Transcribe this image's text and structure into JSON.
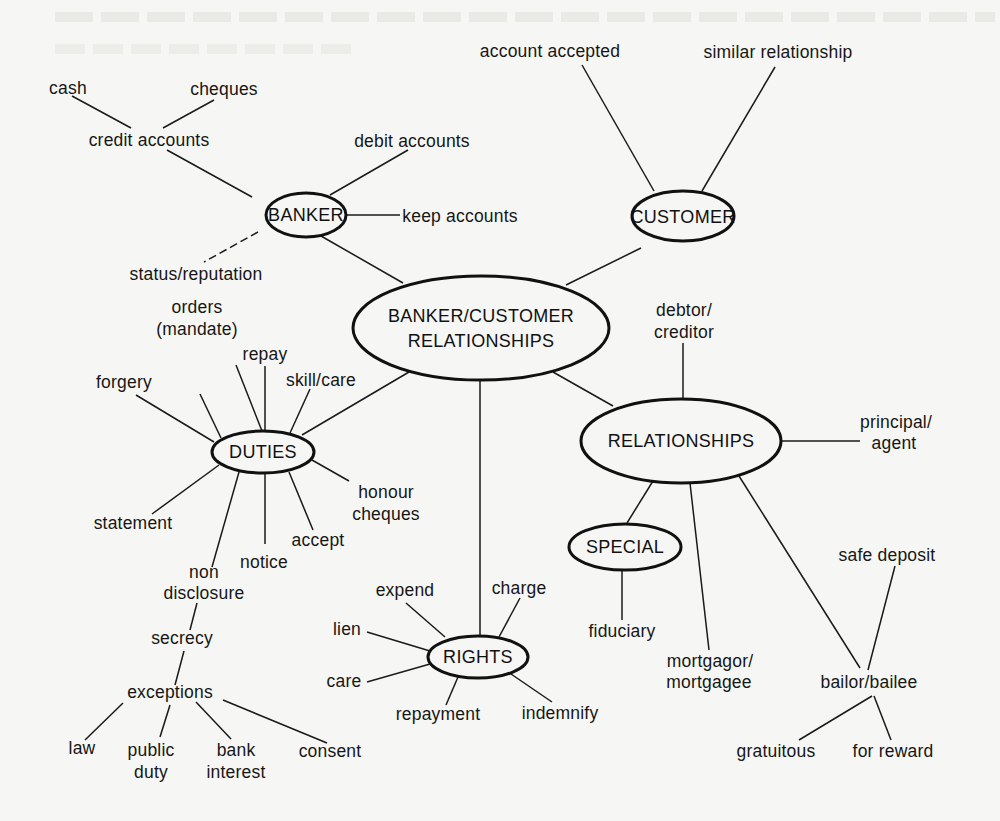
{
  "diagram": {
    "title": "BANKER/CUSTOMER RELATIONSHIPS",
    "colors": {
      "background": "#f6f6f4",
      "ink": "#111111"
    },
    "nodes": {
      "central": {
        "label_line1": "BANKER/CUSTOMER",
        "label_line2": "RELATIONSHIPS",
        "cx": 481,
        "cy": 328,
        "rx": 128,
        "ry": 52
      },
      "banker": {
        "label": "BANKER",
        "cx": 306,
        "cy": 215,
        "rx": 40,
        "ry": 22
      },
      "customer": {
        "label": "CUSTOMER",
        "cx": 683,
        "cy": 216,
        "rx": 51,
        "ry": 25
      },
      "duties": {
        "label": "DUTIES",
        "cx": 263,
        "cy": 452,
        "rx": 51,
        "ry": 21
      },
      "relationships": {
        "label": "RELATIONSHIPS",
        "cx": 681,
        "cy": 441,
        "rx": 100,
        "ry": 42
      },
      "special": {
        "label": "SPECIAL",
        "cx": 625,
        "cy": 547,
        "rx": 56,
        "ry": 23
      },
      "rights": {
        "label": "RIGHTS",
        "cx": 478,
        "cy": 657,
        "rx": 50,
        "ry": 21
      }
    },
    "labels": {
      "cash": "cash",
      "cheques": "cheques",
      "credit_accounts": "credit accounts",
      "debit_accounts": "debit accounts",
      "keep_accounts": "keep accounts",
      "status_reputation": "status/reputation",
      "account_accepted": "account accepted",
      "similar_relationship": "similar relationship",
      "orders_1": "orders",
      "orders_2": "(mandate)",
      "repay": "repay",
      "skill_care": "skill/care",
      "forgery": "forgery",
      "statement": "statement",
      "honour_1": "honour",
      "honour_2": "cheques",
      "accept": "accept",
      "notice": "notice",
      "non_1": "non",
      "non_2": "disclosure",
      "secrecy": "secrecy",
      "exceptions": "exceptions",
      "law": "law",
      "public_1": "public",
      "public_2": "duty",
      "bank_1": "bank",
      "bank_2": "interest",
      "consent": "consent",
      "debtor_1": "debtor/",
      "debtor_2": "creditor",
      "principal_1": "principal/",
      "principal_2": "agent",
      "fiduciary": "fiduciary",
      "mortgagor_1": "mortgagor/",
      "mortgagor_2": "mortgagee",
      "safe_deposit": "safe deposit",
      "bailor_bailee": "bailor/bailee",
      "gratuitous": "gratuitous",
      "for_reward": "for reward",
      "expend": "expend",
      "charge": "charge",
      "lien": "lien",
      "care": "care",
      "repayment": "repayment",
      "indemnify": "indemnify"
    }
  }
}
